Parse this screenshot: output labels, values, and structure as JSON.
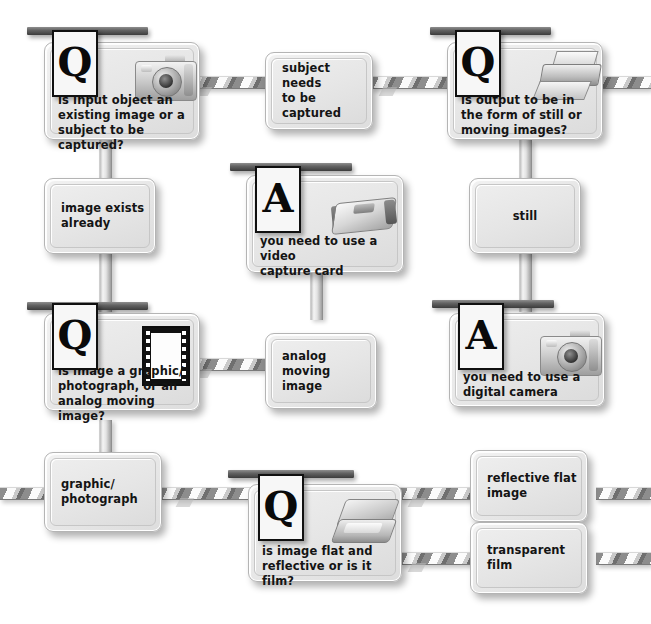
{
  "diagram": {
    "background_color": "#ffffff",
    "node_fill_color": "#e9e9e9",
    "placard_border_color": "#101010",
    "connector_color": "#8d8d8d"
  },
  "nodes": [
    {
      "id": "q-input-object",
      "kind": "question",
      "placard": "Q",
      "icon": "camera-icon",
      "text": "is input object an\nexisting image or a\nsubject to be captured?"
    },
    {
      "id": "subject-needs-captured",
      "kind": "statement",
      "text": "subject needs\nto be captured"
    },
    {
      "id": "q-output-form",
      "kind": "question",
      "placard": "Q",
      "icon": "printer-icon",
      "text": "is output to be in\nthe form of still or\nmoving images?"
    },
    {
      "id": "image-exists-already",
      "kind": "statement",
      "text": "image exists\nalready"
    },
    {
      "id": "a-video-capture-card",
      "kind": "answer",
      "placard": "A",
      "icon": "video-capture-card-icon",
      "text": "you need to use a video\ncapture card"
    },
    {
      "id": "still",
      "kind": "statement",
      "text": "still"
    },
    {
      "id": "q-graphic-or-analog",
      "kind": "question",
      "placard": "Q",
      "icon": "film-strip-icon",
      "text": "is image a graphic/\nphotograph, or an\nanalog moving image?"
    },
    {
      "id": "analog-moving-image",
      "kind": "statement",
      "text": "analog moving\nimage"
    },
    {
      "id": "a-digital-camera",
      "kind": "answer",
      "placard": "A",
      "icon": "camera-icon",
      "text": "you need to use a\ndigital camera"
    },
    {
      "id": "graphic-photograph",
      "kind": "statement",
      "text": "graphic/\nphotograph"
    },
    {
      "id": "q-flat-or-film",
      "kind": "question",
      "placard": "Q",
      "icon": "scanner-icon",
      "text": "is image flat and\nreflective or is it film?"
    },
    {
      "id": "reflective-flat-image",
      "kind": "statement",
      "text": "reflective flat\nimage"
    },
    {
      "id": "transparent-film",
      "kind": "statement",
      "text": "transparent\nfilm"
    }
  ]
}
